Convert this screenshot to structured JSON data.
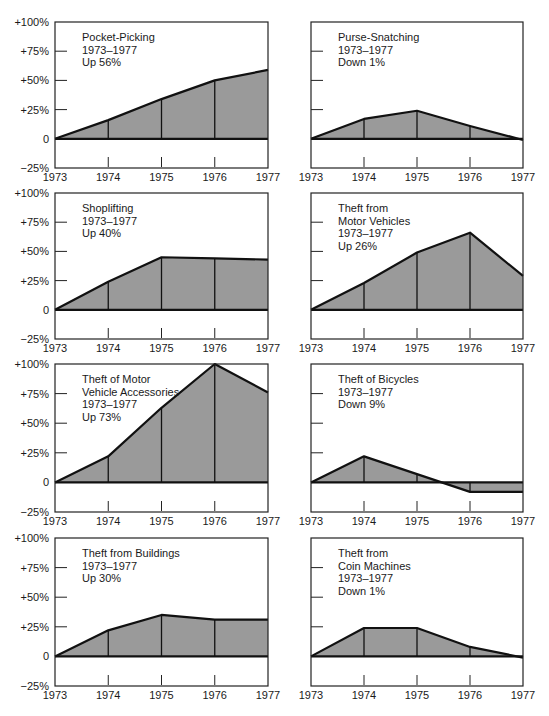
{
  "y_tick_labels": [
    "+100%",
    "+75%",
    "+50%",
    "+25%",
    "0",
    "−25%"
  ],
  "x_tick_labels": [
    "1973",
    "1974",
    "1975",
    "1976",
    "1977"
  ],
  "colors": {
    "fill": "#9a9a9a",
    "line": "#111111",
    "frame": "#222222"
  },
  "chart_data": [
    {
      "type": "area",
      "title": [
        "Pocket-Picking",
        "1973–1977",
        "Up 56%"
      ],
      "x": [
        1973,
        1974,
        1975,
        1976,
        1977
      ],
      "values": [
        0,
        16,
        34,
        50,
        59
      ],
      "ylim": [
        -25,
        100
      ],
      "xlabel": "",
      "ylabel": "Percent change from 1973"
    },
    {
      "type": "area",
      "title": [
        "Purse-Snatching",
        "1973–1977",
        "Down 1%"
      ],
      "x": [
        1973,
        1974,
        1975,
        1976,
        1977
      ],
      "values": [
        0,
        17,
        24,
        11,
        -1
      ],
      "ylim": [
        -25,
        100
      ]
    },
    {
      "type": "area",
      "title": [
        "Shoplifting",
        "1973–1977",
        "Up 40%"
      ],
      "x": [
        1973,
        1974,
        1975,
        1976,
        1977
      ],
      "values": [
        0,
        24,
        45,
        44,
        43
      ],
      "ylim": [
        -25,
        100
      ]
    },
    {
      "type": "area",
      "title": [
        "Theft from",
        "Motor Vehicles",
        "1973–1977",
        "Up 26%"
      ],
      "x": [
        1973,
        1974,
        1975,
        1976,
        1977
      ],
      "values": [
        0,
        23,
        49,
        66,
        29
      ],
      "ylim": [
        -25,
        100
      ]
    },
    {
      "type": "area",
      "title": [
        "Theft of Motor",
        "Vehicle Accessories",
        "1973–1977",
        "Up 73%"
      ],
      "x": [
        1973,
        1974,
        1975,
        1976,
        1977
      ],
      "values": [
        0,
        22,
        63,
        100,
        76
      ],
      "ylim": [
        -25,
        100
      ]
    },
    {
      "type": "area",
      "title": [
        "Theft of Bicycles",
        "1973–1977",
        "Down 9%"
      ],
      "x": [
        1973,
        1974,
        1975,
        1976,
        1977
      ],
      "values": [
        0,
        22,
        7,
        -8,
        -8
      ],
      "ylim": [
        -25,
        100
      ]
    },
    {
      "type": "area",
      "title": [
        "Theft from Buildings",
        "1973–1977",
        "Up 30%"
      ],
      "x": [
        1973,
        1974,
        1975,
        1976,
        1977
      ],
      "values": [
        0,
        22,
        35,
        31,
        31
      ],
      "ylim": [
        -25,
        100
      ]
    },
    {
      "type": "area",
      "title": [
        "Theft from",
        "Coin Machines",
        "1973–1977",
        "Down 1%"
      ],
      "x": [
        1973,
        1974,
        1975,
        1976,
        1977
      ],
      "values": [
        0,
        24,
        24,
        8,
        -1
      ],
      "ylim": [
        -25,
        100
      ]
    }
  ]
}
